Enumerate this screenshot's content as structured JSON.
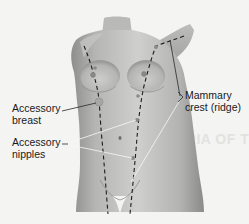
{
  "figure": {
    "type": "anatomical-illustration",
    "colors": {
      "background": "#f4f4f3",
      "skin_light": "#c9c9c7",
      "skin_mid": "#a9a9a7",
      "skin_dark": "#7e7e7c",
      "dashed_line": "#1e1e1e",
      "nipple": "#8a8a88",
      "leader_line": "#f7f7f7"
    }
  },
  "labels": {
    "accessory_breast": {
      "line1": "Accessory",
      "line2": "breast"
    },
    "accessory_nipples": {
      "line1": "Accessory",
      "line2": "nipples"
    },
    "mammary_crest": {
      "line1": "Mammary",
      "line2": "crest (ridge)"
    }
  },
  "background_text": {
    "heading_fragment": "ERIA OF TH"
  }
}
